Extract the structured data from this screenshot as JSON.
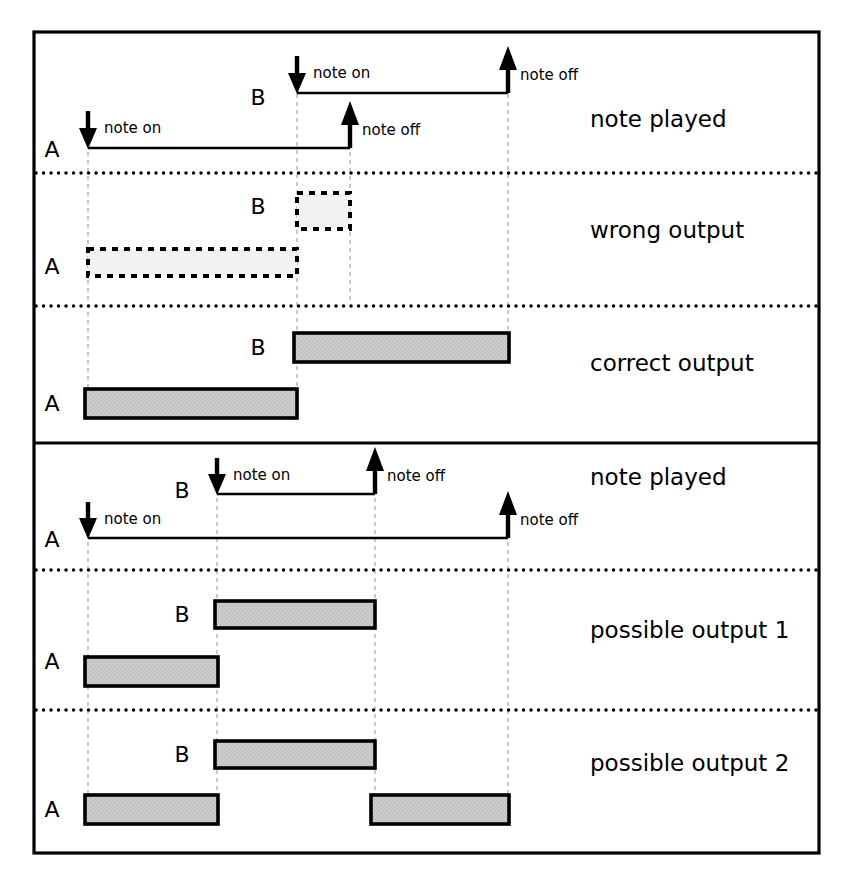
{
  "figure": {
    "title": "",
    "frame": {
      "x": 34,
      "y": 32,
      "width": 785,
      "height": 821,
      "stroke": "#000000",
      "stroke_width": 3
    },
    "colors": {
      "ink": "#000000",
      "bar_fill": "#c8c8c8",
      "guide": "#bbbbbb",
      "background": "#ffffff"
    }
  },
  "panels": [
    {
      "id": "panel-overlap",
      "y": 32,
      "height": 411,
      "rows": [
        {
          "id": "row-note-played-top",
          "label": "note played",
          "label_x": 590,
          "label_y": 126,
          "y_top": 35,
          "y_bottom": 172,
          "tracks": [
            {
              "name": "B",
              "label_x": 258,
              "label_y": 105,
              "line_y": 93,
              "x_start": 297,
              "x_end": 508,
              "on_label": "note on",
              "on_label_x": 313,
              "on_label_y": 78,
              "off_label": "note off",
              "off_label_x": 518,
              "off_label_y": 78,
              "arrow_on_x": 297,
              "arrow_off_x": 508
            },
            {
              "name": "A",
              "label_x": 52,
              "label_y": 155,
              "line_y": 148,
              "x_start": 88,
              "x_end": 350,
              "on_label": "note on",
              "on_label_x": 104,
              "on_label_y": 133,
              "off_label": "note off",
              "off_label_x": 360,
              "off_label_y": 133,
              "arrow_on_x": 88,
              "arrow_off_x": 350
            }
          ]
        },
        {
          "id": "row-wrong-output",
          "label": "wrong output",
          "label_x": 590,
          "label_y": 237,
          "y_top": 172,
          "y_bottom": 305,
          "style": "dashed",
          "tracks": [
            {
              "name": "B",
              "label_x": 258,
              "label_y": 213,
              "bar_x": 297,
              "bar_y": 193,
              "bar_w": 53,
              "bar_h": 36
            },
            {
              "name": "A",
              "label_x": 52,
              "label_y": 272,
              "bar_x": 88,
              "bar_y": 249,
              "bar_w": 209,
              "bar_h": 27
            }
          ]
        },
        {
          "id": "row-correct-output",
          "label": "correct output",
          "label_x": 590,
          "label_y": 370,
          "y_top": 305,
          "y_bottom": 441,
          "style": "filled",
          "tracks": [
            {
              "name": "B",
              "label_x": 258,
              "label_y": 353,
              "bar_x": 294,
              "bar_y": 333,
              "bar_w": 215,
              "bar_h": 29
            },
            {
              "name": "A",
              "label_x": 52,
              "label_y": 410,
              "bar_x": 85,
              "bar_y": 389,
              "bar_w": 212,
              "bar_h": 29
            }
          ]
        }
      ]
    },
    {
      "id": "panel-nested",
      "y": 443,
      "height": 410,
      "rows": [
        {
          "id": "row-note-played-bottom",
          "label": "note played",
          "label_x": 590,
          "label_y": 484,
          "y_top": 446,
          "y_bottom": 567,
          "tracks": [
            {
              "name": "B",
              "label_x": 182,
              "label_y": 494,
              "line_y": 494,
              "x_start": 217,
              "x_end": 375,
              "on_label": "note on",
              "on_label_x": 233,
              "on_label_y": 479,
              "off_label": "note off",
              "off_label_x": 385,
              "off_label_y": 479,
              "arrow_on_x": 217,
              "arrow_off_x": 375
            },
            {
              "name": "A",
              "label_x": 52,
              "label_y": 545,
              "line_y": 538,
              "x_start": 88,
              "x_end": 508,
              "on_label": "note on",
              "on_label_x": 104,
              "on_label_y": 523,
              "off_label": "note off",
              "off_label_x": 518,
              "off_label_y": 523,
              "arrow_on_x": 88,
              "arrow_off_x": 508
            }
          ]
        },
        {
          "id": "row-possible-output-1",
          "label": "possible output 1",
          "label_x": 590,
          "label_y": 637,
          "y_top": 567,
          "y_bottom": 708,
          "style": "filled",
          "tracks": [
            {
              "name": "B",
              "label_x": 182,
              "label_y": 620,
              "bar_x": 215,
              "bar_y": 601,
              "bar_w": 160,
              "bar_h": 27
            },
            {
              "name": "A",
              "label_x": 52,
              "label_y": 667,
              "bar_x": 85,
              "bar_y": 659,
              "bar_w": 133,
              "bar_h": 27
            }
          ]
        },
        {
          "id": "row-possible-output-2",
          "label": "possible output 2",
          "label_x": 590,
          "label_y": 770,
          "y_top": 708,
          "y_bottom": 851,
          "style": "filled",
          "tracks": [
            {
              "name": "B",
              "label_x": 182,
              "label_y": 760,
              "bar_x": 215,
              "bar_y": 741,
              "bar_w": 160,
              "bar_h": 27
            },
            {
              "name": "A",
              "label_x": 52,
              "label_y": 815,
              "bar_x": 85,
              "bar_y": 795,
              "bar_w": 133,
              "bar_h": 29
            },
            {
              "name": "A2",
              "bar_x": 371,
              "bar_y": 795,
              "bar_w": 138,
              "bar_h": 29
            }
          ]
        }
      ]
    }
  ],
  "guides": {
    "top_panel_x": [
      88,
      297,
      350,
      508
    ],
    "bottom_panel_x": [
      88,
      217,
      375,
      508
    ]
  },
  "legend_terms": {
    "note_on": "note on",
    "note_off": "note off",
    "track_a": "A",
    "track_b": "B"
  }
}
